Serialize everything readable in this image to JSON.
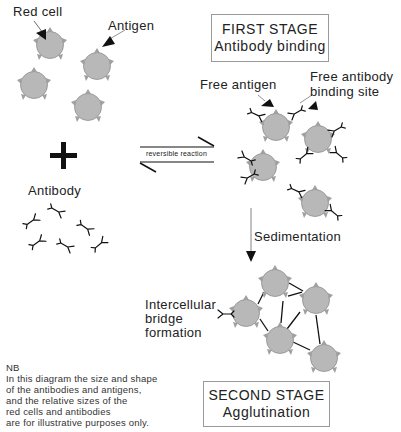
{
  "diagram": {
    "labels": {
      "red_cell": "Red cell",
      "antigen": "Antigen",
      "antibody": "Antibody",
      "free_antigen": "Free antigen",
      "free_antibody_binding_site_line1": "Free antibody",
      "free_antibody_binding_site_line2": "binding site",
      "reversible_reaction": "reversible reaction",
      "sedimentation": "Sedimentation",
      "bridge_line1": "Intercellular",
      "bridge_line2": "bridge",
      "bridge_line3": "formation"
    },
    "first_stage": {
      "title": "FIRST STAGE",
      "subtitle": "Antibody binding"
    },
    "second_stage": {
      "title": "SECOND STAGE",
      "subtitle": "Agglutination"
    },
    "note": {
      "heading": "NB",
      "lines": [
        "In this diagram the size and shape",
        "of the antibodies and antigens,",
        "and the relative sizes of the",
        "red cells and antibodies",
        "are for illustrative purposes only."
      ]
    },
    "colors": {
      "cell_fill": "#b8b8b8",
      "cell_stroke": "#8a8a8a",
      "antigen_fill": "#a0a0a0",
      "line": "#111111",
      "box_border": "#9a9a9a"
    },
    "plus_sign": "+"
  }
}
